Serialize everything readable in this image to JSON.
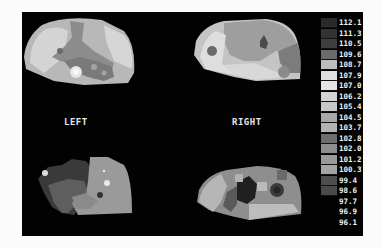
{
  "labels": {
    "left": "LEFT",
    "right": "RIGHT"
  },
  "maps": [
    {
      "name": "top-left",
      "side": "left",
      "view": "upper"
    },
    {
      "name": "top-right",
      "side": "right",
      "view": "upper"
    },
    {
      "name": "bottom-left",
      "side": "left",
      "view": "lower"
    },
    {
      "name": "bottom-right",
      "side": "right",
      "view": "lower"
    }
  ],
  "legend": {
    "items": [
      {
        "value": "112.1",
        "color": "#2a2a2a"
      },
      {
        "value": "111.3",
        "color": "#333333"
      },
      {
        "value": "110.5",
        "color": "#3e3e3e"
      },
      {
        "value": "109.6",
        "color": "#6a6a6a"
      },
      {
        "value": "108.7",
        "color": "#bdbdbd"
      },
      {
        "value": "107.9",
        "color": "#dedede"
      },
      {
        "value": "107.0",
        "color": "#e4e4e4"
      },
      {
        "value": "106.2",
        "color": "#d4d4d4"
      },
      {
        "value": "105.4",
        "color": "#c8c8c8"
      },
      {
        "value": "104.5",
        "color": "#a8a8a8"
      },
      {
        "value": "103.7",
        "color": "#b4b4b4"
      },
      {
        "value": "102.8",
        "color": "#6e6e6e"
      },
      {
        "value": "102.0",
        "color": "#8e8e8e"
      },
      {
        "value": "101.2",
        "color": "#9a9a9a"
      },
      {
        "value": "100.3",
        "color": "#a4a4a4"
      },
      {
        "value": "99.4",
        "color": "#4e4e4e"
      },
      {
        "value": "98.6",
        "color": "#4a4a4a"
      },
      {
        "value": "97.7",
        "color": "#020202"
      },
      {
        "value": "96.9",
        "color": "#020202"
      },
      {
        "value": "96.1",
        "color": "#020202"
      }
    ]
  }
}
